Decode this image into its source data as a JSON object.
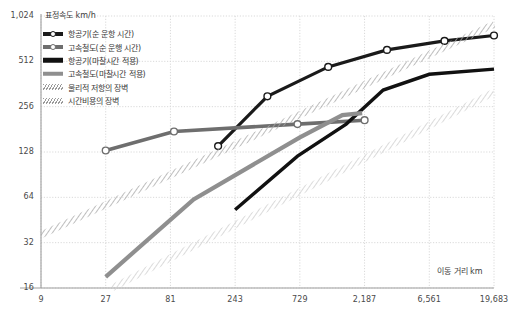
{
  "chart_data": {
    "type": "line",
    "title": "",
    "ylabel": "표정속도 km/h",
    "xlabel": "이동 거리 km",
    "x_scale": "log3",
    "y_scale": "log2",
    "xlim": [
      9,
      19683
    ],
    "ylim": [
      16,
      1024
    ],
    "grid": true,
    "legend_position": "top-left",
    "x_ticks": [
      "9",
      "27",
      "81",
      "243",
      "729",
      "2,187",
      "6,561",
      "19,683"
    ],
    "x_tick_values": [
      9,
      27,
      81,
      243,
      729,
      2187,
      6561,
      19683
    ],
    "y_ticks": [
      "16",
      "32",
      "64",
      "128",
      "256",
      "512",
      "1,024"
    ],
    "y_tick_values": [
      16,
      32,
      64,
      128,
      256,
      512,
      1024
    ],
    "series": [
      {
        "name": "항공기(순 운항 시간)",
        "style": "line-marker",
        "color": "#1a1a1a",
        "width": 3.2,
        "marker": "open-circle",
        "points": [
          {
            "x": 182,
            "y": 140
          },
          {
            "x": 420,
            "y": 300
          },
          {
            "x": 1180,
            "y": 470
          },
          {
            "x": 3200,
            "y": 610
          },
          {
            "x": 8500,
            "y": 700
          },
          {
            "x": 19683,
            "y": 760
          }
        ]
      },
      {
        "name": "고속철도(순 운행 시간)",
        "style": "line-marker",
        "color": "#6e6e6e",
        "width": 3.6,
        "marker": "open-circle",
        "points": [
          {
            "x": 27,
            "y": 131
          },
          {
            "x": 86,
            "y": 175
          },
          {
            "x": 700,
            "y": 196
          },
          {
            "x": 2187,
            "y": 208
          }
        ]
      },
      {
        "name": "항공기(마찰시간 적용)",
        "style": "line",
        "color": "#111111",
        "width": 3.4,
        "marker": "none",
        "points": [
          {
            "x": 243,
            "y": 53
          },
          {
            "x": 700,
            "y": 120
          },
          {
            "x": 1600,
            "y": 196
          },
          {
            "x": 3000,
            "y": 330
          },
          {
            "x": 6561,
            "y": 420
          },
          {
            "x": 19683,
            "y": 455
          }
        ]
      },
      {
        "name": "고속철도(마찰시간 적용)",
        "style": "line",
        "color": "#8f8f8f",
        "width": 4.2,
        "marker": "none",
        "points": [
          {
            "x": 27,
            "y": 19
          },
          {
            "x": 120,
            "y": 62
          },
          {
            "x": 729,
            "y": 160
          },
          {
            "x": 1500,
            "y": 225
          },
          {
            "x": 2100,
            "y": 232
          }
        ]
      },
      {
        "name": "물리적 저항의 장벽",
        "style": "hatched-band",
        "color": "#b5b5b5",
        "width": 7,
        "marker": "none",
        "points": [
          {
            "x": 9,
            "y": 36
          },
          {
            "x": 19683,
            "y": 900
          }
        ]
      },
      {
        "name": "시간비용의 장벽",
        "style": "hatched-band",
        "color": "#c8c8c8",
        "width": 7,
        "marker": "none",
        "points": [
          {
            "x": 30,
            "y": 16
          },
          {
            "x": 19683,
            "y": 320
          }
        ]
      }
    ]
  }
}
